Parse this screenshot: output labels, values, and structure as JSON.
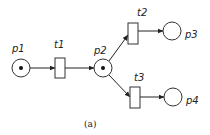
{
  "diagram": {
    "type": "petri-net",
    "caption": "(a)",
    "places": [
      {
        "id": "p1",
        "label": "p1",
        "tokens": 1
      },
      {
        "id": "p2",
        "label": "p2",
        "tokens": 1
      },
      {
        "id": "p3",
        "label": "p3",
        "tokens": 0
      },
      {
        "id": "p4",
        "label": "p4",
        "tokens": 0
      }
    ],
    "transitions": [
      {
        "id": "t1",
        "label": "t1"
      },
      {
        "id": "t2",
        "label": "t2"
      },
      {
        "id": "t3",
        "label": "t3"
      }
    ],
    "arcs": [
      {
        "from": "p1",
        "to": "t1"
      },
      {
        "from": "t1",
        "to": "p2"
      },
      {
        "from": "p2",
        "to": "t2"
      },
      {
        "from": "p2",
        "to": "t3"
      },
      {
        "from": "t2",
        "to": "p3"
      },
      {
        "from": "t3",
        "to": "p4"
      }
    ]
  }
}
